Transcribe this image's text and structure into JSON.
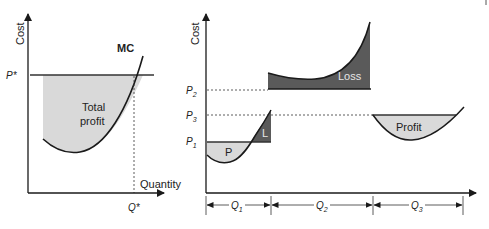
{
  "diagrams": {
    "left": {
      "y_axis_label": "Cost",
      "x_axis_label": "Quantity",
      "curve_label": "MC",
      "price_label": "P*",
      "quantity_label": "Q*",
      "region_label_line1": "Total",
      "region_label_line2": "profit"
    },
    "right": {
      "y_axis_label": "Cost",
      "price_labels": {
        "p2": "P",
        "p2_sub": "2",
        "p3": "P",
        "p3_sub": "3",
        "p1": "P",
        "p1_sub": "1"
      },
      "regions": {
        "p": "P",
        "l": "L",
        "loss": "Loss",
        "profit": "Profit"
      },
      "quantity_labels": {
        "q1": "Q",
        "q1_sub": "1",
        "q2": "Q",
        "q2_sub": "2",
        "q3": "Q",
        "q3_sub": "3"
      }
    }
  },
  "colors": {
    "line": "#1a1a1a",
    "profit_fill": "#d9d9d9",
    "loss_fill": "#5a5a5a",
    "loss_text": "#e6e6e6"
  }
}
